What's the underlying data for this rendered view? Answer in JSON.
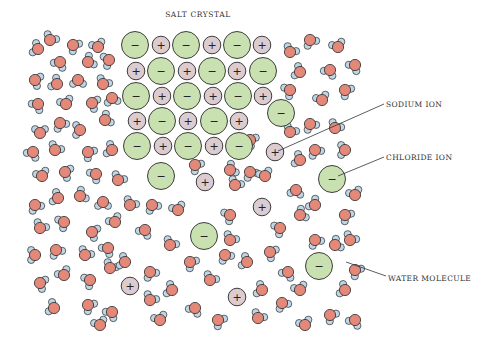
{
  "title": "SALT CRYSTAL",
  "labels": {
    "sodium": "SODIUM ION",
    "chloride": "CHLORIDE ION",
    "water": "WATER MOLECULE"
  },
  "colors": {
    "chloride_fill": "#c9e0b1",
    "sodium_fill": "#dccbcf",
    "oxygen_fill": "#e4897a",
    "hydrogen_fill": "#bed6e6",
    "stroke": "#2a2a2a"
  },
  "symbols": {
    "chloride": "−",
    "sodium": "+"
  },
  "crystal_ions": [
    {
      "t": "cl",
      "x": 135,
      "y": 45
    },
    {
      "t": "na",
      "x": 161,
      "y": 45
    },
    {
      "t": "cl",
      "x": 186,
      "y": 45
    },
    {
      "t": "na",
      "x": 212,
      "y": 45
    },
    {
      "t": "cl",
      "x": 237,
      "y": 45
    },
    {
      "t": "na",
      "x": 262,
      "y": 45
    },
    {
      "t": "na",
      "x": 136,
      "y": 71
    },
    {
      "t": "cl",
      "x": 161,
      "y": 71
    },
    {
      "t": "na",
      "x": 187,
      "y": 71
    },
    {
      "t": "cl",
      "x": 212,
      "y": 71
    },
    {
      "t": "na",
      "x": 237,
      "y": 71
    },
    {
      "t": "cl",
      "x": 263,
      "y": 71
    },
    {
      "t": "cl",
      "x": 136,
      "y": 96
    },
    {
      "t": "na",
      "x": 162,
      "y": 96
    },
    {
      "t": "cl",
      "x": 187,
      "y": 96
    },
    {
      "t": "na",
      "x": 213,
      "y": 96
    },
    {
      "t": "cl",
      "x": 238,
      "y": 96
    },
    {
      "t": "na",
      "x": 263,
      "y": 96
    },
    {
      "t": "na",
      "x": 137,
      "y": 121
    },
    {
      "t": "cl",
      "x": 162,
      "y": 121
    },
    {
      "t": "na",
      "x": 188,
      "y": 121
    },
    {
      "t": "cl",
      "x": 214,
      "y": 121
    },
    {
      "t": "na",
      "x": 239,
      "y": 121
    },
    {
      "t": "cl",
      "x": 137,
      "y": 146
    },
    {
      "t": "na",
      "x": 163,
      "y": 146
    },
    {
      "t": "cl",
      "x": 188,
      "y": 146
    },
    {
      "t": "na",
      "x": 214,
      "y": 146
    },
    {
      "t": "cl",
      "x": 239,
      "y": 146
    },
    {
      "t": "cl",
      "x": 161,
      "y": 176
    },
    {
      "t": "na",
      "x": 205,
      "y": 182
    },
    {
      "t": "cl",
      "x": 281,
      "y": 113
    }
  ],
  "free_ions": [
    {
      "t": "na",
      "x": 275,
      "y": 152,
      "id": "sodium-ion-labeled"
    },
    {
      "t": "na",
      "x": 262,
      "y": 207
    },
    {
      "t": "cl",
      "x": 332,
      "y": 179,
      "id": "chloride-ion-labeled"
    },
    {
      "t": "cl",
      "x": 204,
      "y": 236
    },
    {
      "t": "cl",
      "x": 319,
      "y": 266
    },
    {
      "t": "na",
      "x": 130,
      "y": 286
    },
    {
      "t": "na",
      "x": 237,
      "y": 297
    }
  ],
  "water_molecules": [
    [
      38,
      49,
      200
    ],
    [
      50,
      40,
      300
    ],
    [
      73,
      45,
      40
    ],
    [
      98,
      47,
      250
    ],
    [
      109,
      60,
      160
    ],
    [
      60,
      62,
      120
    ],
    [
      88,
      62,
      330
    ],
    [
      35,
      80,
      20
    ],
    [
      57,
      84,
      210
    ],
    [
      78,
      80,
      90
    ],
    [
      103,
      84,
      300
    ],
    [
      38,
      104,
      130
    ],
    [
      66,
      104,
      250
    ],
    [
      92,
      103,
      20
    ],
    [
      112,
      98,
      80
    ],
    [
      40,
      133,
      270
    ],
    [
      60,
      123,
      60
    ],
    [
      80,
      130,
      180
    ],
    [
      105,
      120,
      330
    ],
    [
      33,
      152,
      120
    ],
    [
      55,
      150,
      300
    ],
    [
      88,
      152,
      40
    ],
    [
      112,
      150,
      200
    ],
    [
      42,
      176,
      250
    ],
    [
      65,
      172,
      20
    ],
    [
      96,
      174,
      140
    ],
    [
      118,
      180,
      300
    ],
    [
      35,
      205,
      60
    ],
    [
      58,
      198,
      200
    ],
    [
      80,
      196,
      330
    ],
    [
      103,
      202,
      90
    ],
    [
      40,
      228,
      300
    ],
    [
      64,
      222,
      150
    ],
    [
      92,
      232,
      20
    ],
    [
      115,
      222,
      240
    ],
    [
      35,
      255,
      180
    ],
    [
      56,
      250,
      60
    ],
    [
      85,
      255,
      300
    ],
    [
      108,
      248,
      130
    ],
    [
      40,
      283,
      20
    ],
    [
      64,
      275,
      240
    ],
    [
      90,
      280,
      150
    ],
    [
      110,
      268,
      300
    ],
    [
      54,
      308,
      200
    ],
    [
      88,
      305,
      40
    ],
    [
      112,
      312,
      130
    ],
    [
      150,
      300,
      300
    ],
    [
      150,
      272,
      60
    ],
    [
      125,
      262,
      200
    ],
    [
      100,
      325,
      250
    ],
    [
      172,
      290,
      200
    ],
    [
      190,
      262,
      40
    ],
    [
      170,
      245,
      300
    ],
    [
      145,
      230,
      120
    ],
    [
      130,
      205,
      300
    ],
    [
      152,
      205,
      60
    ],
    [
      178,
      210,
      250
    ],
    [
      230,
      215,
      150
    ],
    [
      235,
      185,
      300
    ],
    [
      250,
      172,
      60
    ],
    [
      210,
      280,
      300
    ],
    [
      195,
      308,
      120
    ],
    [
      218,
      320,
      40
    ],
    [
      262,
      290,
      200
    ],
    [
      258,
      318,
      300
    ],
    [
      282,
      303,
      60
    ],
    [
      300,
      290,
      250
    ],
    [
      288,
      272,
      120
    ],
    [
      270,
      252,
      30
    ],
    [
      247,
      262,
      200
    ],
    [
      225,
      255,
      60
    ],
    [
      230,
      240,
      300
    ],
    [
      280,
      228,
      150
    ],
    [
      300,
      215,
      330
    ],
    [
      296,
      190,
      100
    ],
    [
      315,
      205,
      220
    ],
    [
      345,
      215,
      40
    ],
    [
      350,
      240,
      300
    ],
    [
      355,
      195,
      250
    ],
    [
      315,
      150,
      60
    ],
    [
      300,
      160,
      200
    ],
    [
      290,
      132,
      300
    ],
    [
      310,
      124,
      60
    ],
    [
      335,
      128,
      300
    ],
    [
      345,
      150,
      180
    ],
    [
      322,
      100,
      250
    ],
    [
      345,
      90,
      40
    ],
    [
      330,
      70,
      120
    ],
    [
      300,
      72,
      200
    ],
    [
      290,
      52,
      300
    ],
    [
      310,
      40,
      60
    ],
    [
      338,
      47,
      250
    ],
    [
      355,
      65,
      130
    ],
    [
      250,
      140,
      30
    ],
    [
      290,
      90,
      150
    ],
    [
      265,
      176,
      250
    ],
    [
      230,
      170,
      330
    ],
    [
      330,
      315,
      40
    ],
    [
      305,
      325,
      250
    ],
    [
      345,
      290,
      200
    ],
    [
      355,
      320,
      120
    ],
    [
      355,
      270,
      40
    ],
    [
      335,
      245,
      330
    ],
    [
      315,
      240,
      60
    ],
    [
      195,
      165,
      40
    ],
    [
      160,
      320,
      250
    ]
  ]
}
